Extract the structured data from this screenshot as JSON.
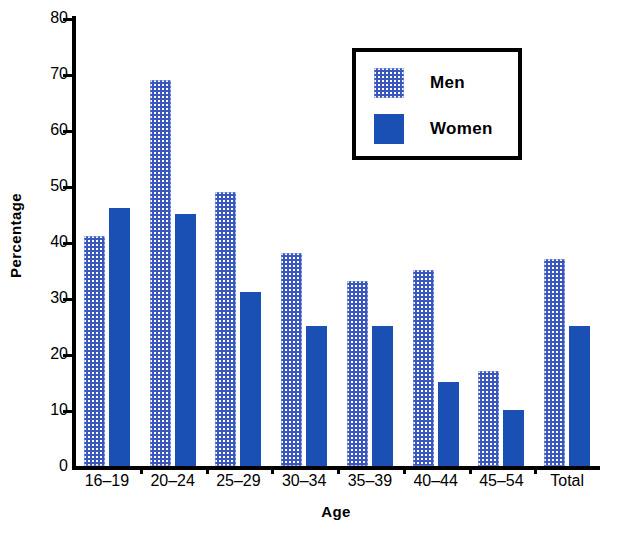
{
  "chart_data": {
    "type": "bar",
    "title": "",
    "xlabel": "Age",
    "ylabel": "Percentage",
    "ylim": [
      0,
      80
    ],
    "ytick_step": 10,
    "yticks": [
      0,
      10,
      20,
      30,
      40,
      50,
      60,
      70,
      80
    ],
    "grid": false,
    "legend_position": "upper right",
    "categories": [
      "16–19",
      "20–24",
      "25–29",
      "30–34",
      "35–39",
      "40–44",
      "45–54",
      "Total"
    ],
    "series": [
      {
        "name": "Men",
        "fill": "stipple-blue",
        "color": "#3a57bd",
        "values": [
          41,
          69,
          49,
          38,
          33,
          35,
          17,
          37
        ]
      },
      {
        "name": "Women",
        "fill": "solid-blue",
        "color": "#1a4fb4",
        "values": [
          46,
          45,
          31,
          25,
          25,
          15,
          10,
          25
        ]
      }
    ]
  },
  "legend": {
    "items": [
      {
        "label": "Men"
      },
      {
        "label": "Women"
      }
    ]
  },
  "colors": {
    "men": "#3a57bd",
    "women": "#1a4fb4",
    "axis": "#000000",
    "background": "#ffffff"
  }
}
